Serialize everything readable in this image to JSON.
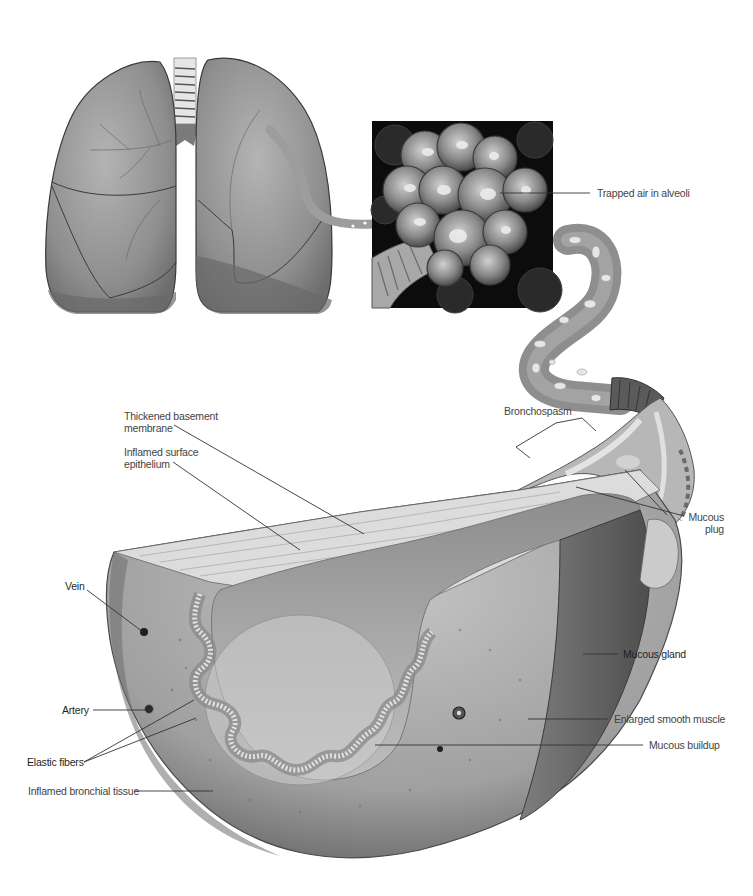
{
  "figure": {
    "panels": [
      "lungs",
      "alveoli-inset",
      "bronchiole-tube",
      "bronchus-cross-section"
    ]
  },
  "labels": {
    "trapped_air": "Trapped air in alveoli",
    "thickened_membrane_1": "Thickened basement",
    "thickened_membrane_2": "membrane",
    "inflamed_epithelium_1": "Inflamed surface",
    "inflamed_epithelium_2": "epithelium",
    "bronchospasm": "Bronchospasm",
    "mucous_plug_1": "Mucous",
    "mucous_plug_2": "plug",
    "vein": "Vein",
    "artery": "Artery",
    "elastic_fibers": "Elastic fibers",
    "inflamed_tissue": "Inflamed bronchial tissue",
    "mucous_gland": "Mucous gland",
    "enlarged_muscle": "Enlarged smooth muscle",
    "mucous_buildup": "Mucous buildup"
  },
  "colors": {
    "background": "#ffffff",
    "tissue_light": "#c8c8c8",
    "tissue_mid": "#9a9a9a",
    "tissue_dark": "#5e5e5e",
    "inset_bg": "#0c0c0c",
    "leader_line": "#333333"
  }
}
